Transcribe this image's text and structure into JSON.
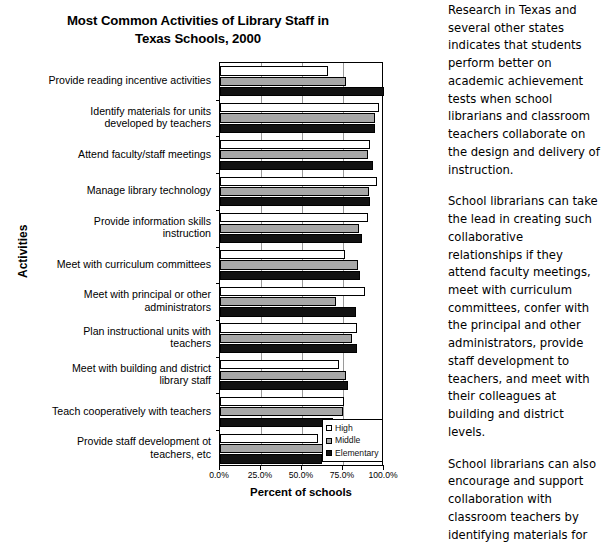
{
  "chart_data": {
    "type": "bar",
    "orientation": "horizontal",
    "title": "Most Common Activities of Library Staff in Texas Schools, 2000",
    "title_line1": "Most Common Activities of Library Staff in",
    "title_line2": "Texas Schools, 2000",
    "xlabel": "Percent of schools",
    "ylabel": "Activities",
    "xlim": [
      0,
      100
    ],
    "xticks": [
      "0.0%",
      "25.0%",
      "50.0%",
      "75.0%",
      "100.0%"
    ],
    "xtick_values": [
      0,
      25,
      50,
      75,
      100
    ],
    "grid": true,
    "legend_position": "bottom-right",
    "categories": [
      "Provide reading incentive activities",
      "Identify materials for units developed by teachers",
      "Attend faculty/staff meetings",
      "Manage library technology",
      "Provide information skills instruction",
      "Meet with curriculum committees",
      "Meet with principal or other administrators",
      "Plan instructional units with teachers",
      "Meet with building and district library staff",
      "Teach cooperatively with teachers",
      "Provide staff development ot teachers, etc"
    ],
    "category_lines": [
      [
        "Provide reading incentive activities"
      ],
      [
        "Identify materials for units",
        "developed by teachers"
      ],
      [
        "Attend faculty/staff meetings"
      ],
      [
        "Manage library technology"
      ],
      [
        "Provide information skills",
        "instruction"
      ],
      [
        "Meet with curriculum committees"
      ],
      [
        "Meet with principal or other",
        "administrators"
      ],
      [
        "Plan instructional units with",
        "teachers"
      ],
      [
        "Meet with building and district",
        "library staff"
      ],
      [
        "Teach cooperatively with teachers"
      ],
      [
        "Provide staff development ot",
        "teachers, etc"
      ]
    ],
    "series": [
      {
        "name": "High",
        "color": "#ffffff",
        "values": [
          66,
          97,
          91.5,
          95.5,
          90,
          76,
          88.5,
          83.5,
          72.5,
          75.5,
          60
        ]
      },
      {
        "name": "Middle",
        "color": "#a8a8a8",
        "values": [
          77,
          94.5,
          90,
          91,
          85,
          84,
          71,
          80.5,
          77,
          75,
          63
        ]
      },
      {
        "name": "Elementary",
        "color": "#121212",
        "values": [
          100,
          94.5,
          93,
          91.5,
          86.5,
          85.5,
          83,
          83.5,
          78,
          69,
          62
        ]
      }
    ]
  },
  "legend": {
    "items": [
      {
        "label": "High"
      },
      {
        "label": "Middle"
      },
      {
        "label": "Elementary"
      }
    ]
  },
  "sidebar_text": {
    "paragraphs": [
      "Research in Texas and several other states indicates that students perform better on academic achievement tests when school librarians and classroom teachers collaborate on the design and delivery of instruction.",
      "School librarians can take the lead in creating such collaborative relationships if they attend faculty meetings, meet with curriculum committees, confer with the principal and other administrators, provide staff development to teachers, and meet with their colleagues at building and district levels.",
      "School librarians can also encourage and support collaboration with classroom teachers by identifying materials for"
    ]
  }
}
